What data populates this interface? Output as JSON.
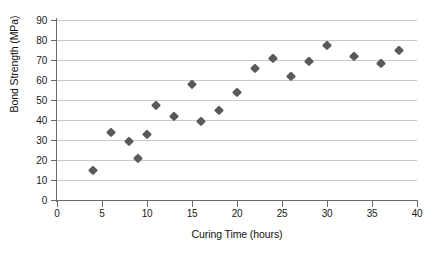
{
  "chart_data": {
    "type": "scatter",
    "title": "",
    "xlabel": "Curing Time (hours)",
    "ylabel": "Bond Strength (MPa)",
    "xlim": [
      0,
      40
    ],
    "ylim": [
      0,
      90
    ],
    "xticks": [
      0,
      5,
      10,
      15,
      20,
      25,
      30,
      35,
      40
    ],
    "yticks": [
      0,
      10,
      20,
      30,
      40,
      50,
      60,
      70,
      80,
      90
    ],
    "grid": "horizontal",
    "legend": "none",
    "marker": "diamond",
    "marker_color": "#595959",
    "grid_color": "#c9c9c9",
    "axis_color": "#6b6b6b",
    "x": [
      4,
      6,
      8,
      9,
      10,
      11,
      13,
      15,
      16,
      18,
      20,
      22,
      24,
      26,
      28,
      30,
      33,
      36,
      38
    ],
    "y": [
      15,
      34,
      29.5,
      21,
      33,
      47.5,
      42,
      58,
      39.5,
      45,
      54,
      66,
      71,
      62,
      69.5,
      77.5,
      72,
      68.5,
      75
    ],
    "points": [
      {
        "x": 4,
        "y": 15
      },
      {
        "x": 6,
        "y": 34
      },
      {
        "x": 8,
        "y": 29.5
      },
      {
        "x": 9,
        "y": 21
      },
      {
        "x": 10,
        "y": 33
      },
      {
        "x": 11,
        "y": 47.5
      },
      {
        "x": 13,
        "y": 42
      },
      {
        "x": 15,
        "y": 58
      },
      {
        "x": 16,
        "y": 39.5
      },
      {
        "x": 18,
        "y": 45
      },
      {
        "x": 20,
        "y": 54
      },
      {
        "x": 22,
        "y": 66
      },
      {
        "x": 24,
        "y": 71
      },
      {
        "x": 26,
        "y": 62
      },
      {
        "x": 28,
        "y": 69.5
      },
      {
        "x": 30,
        "y": 77.5
      },
      {
        "x": 33,
        "y": 72
      },
      {
        "x": 36,
        "y": 68.5
      },
      {
        "x": 38,
        "y": 75
      }
    ]
  }
}
